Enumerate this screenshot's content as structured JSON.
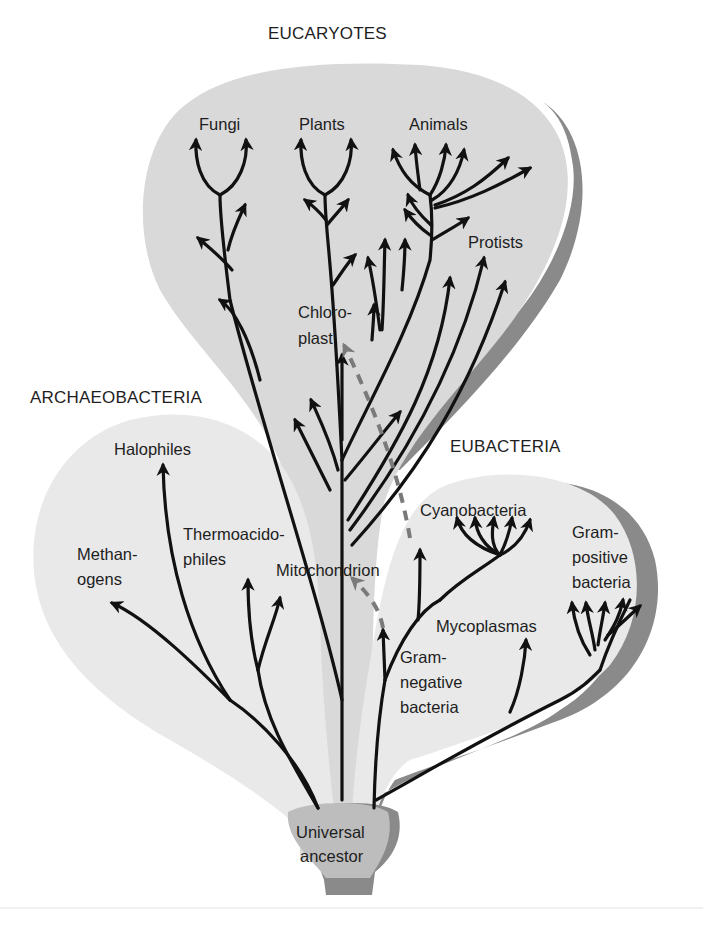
{
  "diagram": {
    "type": "phylogenetic-tree",
    "colors": {
      "background": "#ffffff",
      "eucaryote_region": "#d9d9d9",
      "bacteria_region": "#e9e9e9",
      "shadow": "#8a8a8a",
      "ancestor": "#bdbdbd",
      "branch": "#111111",
      "endosymbiosis_dash": "#7a7a7a"
    },
    "domains": {
      "eucaryotes": "EUCARYOTES",
      "archaeobacteria": "ARCHAEOBACTERIA",
      "eubacteria": "EUBACTERIA"
    },
    "root": {
      "line1": "Universal",
      "line2": "ancestor"
    },
    "eucaryote_groups": {
      "fungi": "Fungi",
      "plants": "Plants",
      "animals": "Animals",
      "protists": "Protists"
    },
    "archaeobacteria_groups": {
      "halophiles": "Halophiles",
      "methanogens_l1": "Methan-",
      "methanogens_l2": "ogens",
      "thermo_l1": "Thermoacido-",
      "thermo_l2": "philes"
    },
    "eubacteria_groups": {
      "cyanobacteria": "Cyanobacteria",
      "mycoplasmas": "Mycoplasmas",
      "gram_pos_l1": "Gram-",
      "gram_pos_l2": "positive",
      "gram_pos_l3": "bacteria",
      "gram_neg_l1": "Gram-",
      "gram_neg_l2": "negative",
      "gram_neg_l3": "bacteria"
    },
    "organelles": {
      "chloroplast_l1": "Chloro-",
      "chloroplast_l2": "plast",
      "mitochondrion": "Mitochondrion"
    }
  }
}
